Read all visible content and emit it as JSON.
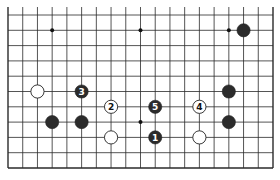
{
  "diagram": {
    "type": "go-board-fragment",
    "visible_columns": 19,
    "visible_rows": 11,
    "edges": [
      "left",
      "bottom",
      "right"
    ],
    "colors": {
      "line": "#2a2a2a",
      "black_stone": "#2b2b2b",
      "white_stone": "#ffffff",
      "background": "#ffffff"
    },
    "star_points": [
      {
        "col": 3,
        "row": 1
      },
      {
        "col": 9,
        "row": 1
      },
      {
        "col": 15,
        "row": 1
      },
      {
        "col": 3,
        "row": 7
      },
      {
        "col": 9,
        "row": 7
      },
      {
        "col": 15,
        "row": 7
      }
    ],
    "stones": [
      {
        "color": "black",
        "col": 16,
        "row": 1,
        "label": ""
      },
      {
        "color": "white",
        "col": 2,
        "row": 5,
        "label": ""
      },
      {
        "color": "black",
        "col": 5,
        "row": 5,
        "label": "3"
      },
      {
        "color": "black",
        "col": 15,
        "row": 5,
        "label": ""
      },
      {
        "color": "white",
        "col": 7,
        "row": 6,
        "label": "2"
      },
      {
        "color": "black",
        "col": 10,
        "row": 6,
        "label": "5"
      },
      {
        "color": "white",
        "col": 13,
        "row": 6,
        "label": "4"
      },
      {
        "color": "black",
        "col": 3,
        "row": 7,
        "label": ""
      },
      {
        "color": "black",
        "col": 5,
        "row": 7,
        "label": ""
      },
      {
        "color": "black",
        "col": 15,
        "row": 7,
        "label": ""
      },
      {
        "color": "white",
        "col": 7,
        "row": 8,
        "label": ""
      },
      {
        "color": "black",
        "col": 10,
        "row": 8,
        "label": "1"
      },
      {
        "color": "white",
        "col": 13,
        "row": 8,
        "label": ""
      }
    ]
  }
}
